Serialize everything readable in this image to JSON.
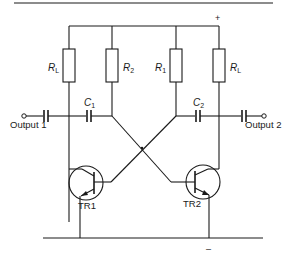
{
  "diagram": {
    "type": "astable multivibrator circuit schematic",
    "supply": {
      "positive_label": "+",
      "negative_label": "–"
    },
    "resistors": [
      {
        "id": "RL_left",
        "symbol": "R",
        "subscript": "L"
      },
      {
        "id": "R2",
        "symbol": "R",
        "subscript": "2"
      },
      {
        "id": "R1",
        "symbol": "R",
        "subscript": "1"
      },
      {
        "id": "RL_right",
        "symbol": "R",
        "subscript": "L"
      }
    ],
    "capacitors": [
      {
        "id": "C1",
        "symbol": "C",
        "subscript": "1"
      },
      {
        "id": "C2",
        "symbol": "C",
        "subscript": "2"
      }
    ],
    "transistors": [
      {
        "id": "TR1",
        "label": "TR1",
        "type": "NPN"
      },
      {
        "id": "TR2",
        "label": "TR2",
        "type": "NPN"
      }
    ],
    "outputs": [
      {
        "id": "out1",
        "label": "Output 1"
      },
      {
        "id": "out2",
        "label": "Output 2"
      }
    ],
    "colors": {
      "ink": "#1a1a1a",
      "background": "#ffffff"
    }
  }
}
